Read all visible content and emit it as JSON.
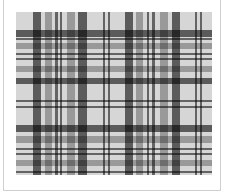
{
  "image": {
    "subject": "tartan-plaid-pattern",
    "background_color": "#d6d6d6",
    "frame_border_color": "#cfcfcf",
    "palette": {
      "dark": "#3a3a3a",
      "medium": "#7a7a7a",
      "thin": "#555555"
    },
    "vertical_stripes": [
      {
        "x": 17,
        "w": 8,
        "tone": "dark"
      },
      {
        "x": 29,
        "w": 7,
        "tone": "medium"
      },
      {
        "x": 39,
        "w": 3,
        "tone": "thin"
      },
      {
        "x": 44,
        "w": 2,
        "tone": "thin"
      },
      {
        "x": 51,
        "w": 8,
        "tone": "medium"
      },
      {
        "x": 62,
        "w": 9,
        "tone": "dark"
      },
      {
        "x": 87,
        "w": 2,
        "tone": "thin"
      },
      {
        "x": 92,
        "w": 2,
        "tone": "thin"
      },
      {
        "x": 109,
        "w": 8,
        "tone": "dark"
      },
      {
        "x": 120,
        "w": 7,
        "tone": "medium"
      },
      {
        "x": 131,
        "w": 2,
        "tone": "thin"
      },
      {
        "x": 136,
        "w": 3,
        "tone": "thin"
      },
      {
        "x": 144,
        "w": 8,
        "tone": "medium"
      },
      {
        "x": 156,
        "w": 8,
        "tone": "dark"
      },
      {
        "x": 179,
        "w": 2,
        "tone": "thin"
      },
      {
        "x": 184,
        "w": 2,
        "tone": "thin"
      }
    ],
    "horizontal_stripes": [
      {
        "y": 18,
        "h": 7,
        "tone": "dark"
      },
      {
        "y": 26,
        "h": 2,
        "tone": "thin"
      },
      {
        "y": 31,
        "h": 6,
        "tone": "medium"
      },
      {
        "y": 41,
        "h": 2,
        "tone": "thin"
      },
      {
        "y": 46,
        "h": 2,
        "tone": "thin"
      },
      {
        "y": 54,
        "h": 6,
        "tone": "medium"
      },
      {
        "y": 66,
        "h": 6,
        "tone": "dark"
      },
      {
        "y": 88,
        "h": 2,
        "tone": "thin"
      },
      {
        "y": 94,
        "h": 2,
        "tone": "thin"
      },
      {
        "y": 113,
        "h": 7,
        "tone": "dark"
      },
      {
        "y": 124,
        "h": 7,
        "tone": "medium"
      },
      {
        "y": 136,
        "h": 2,
        "tone": "thin"
      },
      {
        "y": 141,
        "h": 2,
        "tone": "thin"
      },
      {
        "y": 148,
        "h": 6,
        "tone": "medium"
      },
      {
        "y": 159,
        "h": 2,
        "tone": "thin"
      }
    ]
  }
}
